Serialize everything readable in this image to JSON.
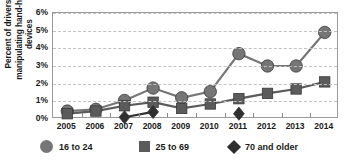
{
  "chart_data": {
    "type": "line",
    "title": "",
    "xlabel": "",
    "ylabel": "Percent of drivers manipulating hand-held devices",
    "categories": [
      "2005",
      "2006",
      "2007",
      "2008",
      "2009",
      "2010",
      "2011",
      "2012",
      "2013",
      "2014"
    ],
    "ylim": [
      0,
      6
    ],
    "ytick_labels": [
      "0%",
      "1%",
      "2%",
      "3%",
      "4%",
      "5%",
      "6%"
    ],
    "ytick_values": [
      0,
      1,
      2,
      3,
      4,
      5,
      6
    ],
    "grid": true,
    "legend_position": "bottom",
    "series": [
      {
        "name": "16 to 24",
        "marker": "circle",
        "color": "#767676",
        "values": [
          0.45,
          0.55,
          1.05,
          1.75,
          1.2,
          1.55,
          3.7,
          3.0,
          3.0,
          4.9
        ]
      },
      {
        "name": "25 to 69",
        "marker": "square",
        "color": "#5b5b5b",
        "values": [
          0.3,
          0.45,
          0.75,
          0.95,
          0.6,
          0.85,
          1.15,
          1.45,
          1.7,
          2.1
        ]
      },
      {
        "name": "70 and older",
        "marker": "diamond",
        "color": "#2f2f2f",
        "values": [
          null,
          null,
          0.1,
          0.4,
          null,
          null,
          0.3,
          null,
          null,
          null
        ]
      }
    ]
  },
  "legend": {
    "items": [
      {
        "label": "16 to 24",
        "marker": "circle-marker-icon"
      },
      {
        "label": "25 to 69",
        "marker": "square-marker-icon"
      },
      {
        "label": "70 and older",
        "marker": "diamond-marker-icon"
      }
    ]
  }
}
